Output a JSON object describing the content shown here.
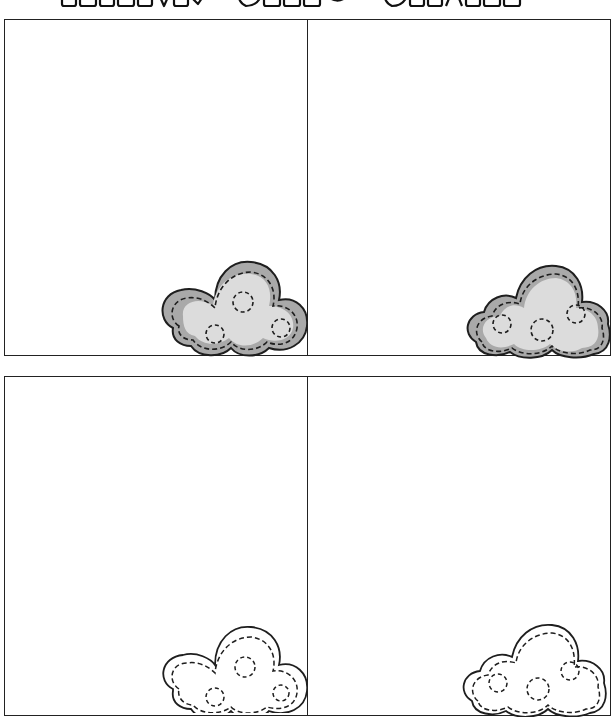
{
  "title": {
    "text": "Rainy Cloud Craft",
    "note": "partially cropped outlined bubble lettering at top"
  },
  "rows": [
    {
      "panels": [
        {
          "id": "top-left",
          "cloud": {
            "style": "shaded",
            "fill": "#d7d7d7",
            "shade": "#a8a8a8",
            "outline": "#222222",
            "stitch": "dashed"
          }
        },
        {
          "id": "top-right",
          "cloud": {
            "style": "shaded",
            "fill": "#d7d7d7",
            "shade": "#a8a8a8",
            "outline": "#222222",
            "stitch": "dashed"
          }
        }
      ]
    },
    {
      "panels": [
        {
          "id": "bottom-left",
          "cloud": {
            "style": "outline",
            "fill": "#ffffff",
            "outline": "#222222",
            "stitch": "dashed"
          }
        },
        {
          "id": "bottom-right",
          "cloud": {
            "style": "outline",
            "fill": "#ffffff",
            "outline": "#222222",
            "stitch": "dashed"
          }
        }
      ]
    }
  ],
  "colors": {
    "border": "#222222",
    "background": "#ffffff"
  }
}
